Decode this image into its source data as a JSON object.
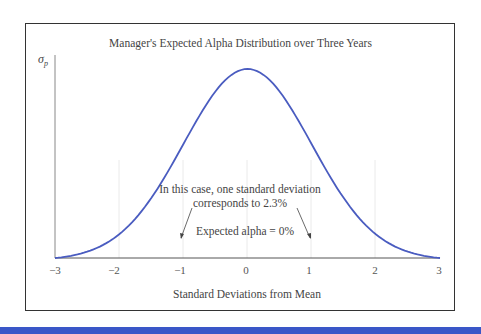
{
  "chart_data": {
    "type": "line",
    "title": "Manager's Expected Alpha Distribution over Three Years",
    "xlabel": "Standard Deviations from Mean",
    "ylabel": "σp",
    "x_ticks": [
      "−3",
      "−2",
      "−1",
      "0",
      "1",
      "2",
      "3"
    ],
    "xlim": [
      -3,
      3
    ],
    "series": [
      {
        "name": "Normal distribution of expected alpha",
        "function": "standard normal pdf",
        "mean": 0,
        "sd": 1,
        "color": "#4a5cc0"
      }
    ],
    "annotations": [
      "In this case, one standard deviation corresponds to 2.3%",
      "Expected alpha = 0%"
    ],
    "grid": "faint vertical lines at integer ticks",
    "legend": "none"
  },
  "labels": {
    "title": "Manager's Expected Alpha Distribution over Three Years",
    "ylabel_main": "σ",
    "ylabel_sub": "p",
    "xlabel": "Standard Deviations from Mean",
    "annotation_line1": "In this case, one standard deviation",
    "annotation_line2": "corresponds to 2.3%",
    "annotation_expected": "Expected alpha = 0%",
    "ticks": [
      "−3",
      "−2",
      "−1",
      "0",
      "1",
      "2",
      "3"
    ]
  },
  "colors": {
    "curve": "#4a5cc0",
    "footer_bar": "#3a57c8",
    "frame": "#333333"
  }
}
